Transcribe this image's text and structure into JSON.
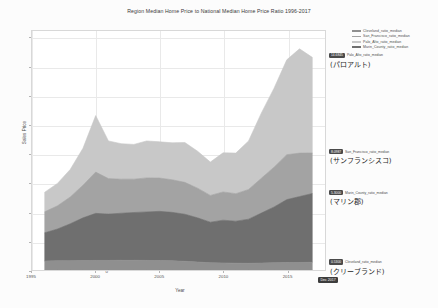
{
  "chart_data": {
    "type": "area",
    "title": "Region Median Home Price to National Median Home Price Ratio 1996-2017",
    "xlabel": "Year",
    "ylabel": "Sales Price",
    "stacked": true,
    "grid": true,
    "legend_position": "top-right",
    "xlim": [
      1995,
      2018
    ],
    "ylim": [
      0,
      16.5
    ],
    "xticks": [
      "1995",
      "2000",
      "2005",
      "2010",
      "2015"
    ],
    "yticks": [
      "0",
      "2",
      "4",
      "6",
      "8",
      "10",
      "12",
      "14",
      "16"
    ],
    "x": [
      1996,
      1997,
      1998,
      1999,
      2000,
      2001,
      2002,
      2003,
      2004,
      2005,
      2006,
      2007,
      2008,
      2009,
      2010,
      2011,
      2012,
      2013,
      2014,
      2015,
      2016,
      2017
    ],
    "series": [
      {
        "name": "Cleveland_ratio_median",
        "color": "#8f8f8f",
        "values": [
          0.62,
          0.63,
          0.64,
          0.65,
          0.66,
          0.66,
          0.67,
          0.67,
          0.66,
          0.65,
          0.63,
          0.6,
          0.55,
          0.5,
          0.49,
          0.47,
          0.46,
          0.48,
          0.5,
          0.51,
          0.52,
          0.53
        ]
      },
      {
        "name": "Marin_County_ratio_median",
        "color": "#6f6f6f",
        "values": [
          1.95,
          2.2,
          2.55,
          2.95,
          3.25,
          3.2,
          3.25,
          3.3,
          3.35,
          3.4,
          3.35,
          3.25,
          3.05,
          2.8,
          2.95,
          2.9,
          3.05,
          3.45,
          3.85,
          4.35,
          4.55,
          4.75
        ]
      },
      {
        "name": "San_Francisco_ratio_median",
        "color": "#a3a3a3",
        "values": [
          1.45,
          1.6,
          1.85,
          2.25,
          2.85,
          2.45,
          2.35,
          2.3,
          2.35,
          2.3,
          2.25,
          2.2,
          2.05,
          1.85,
          1.95,
          1.9,
          2.05,
          2.4,
          2.75,
          3.1,
          3.0,
          2.8
        ]
      },
      {
        "name": "Palo_Alto_ratio_median",
        "color": "#c8c8c8",
        "values": [
          1.35,
          1.55,
          1.9,
          2.55,
          3.9,
          2.6,
          2.45,
          2.4,
          2.55,
          2.5,
          2.55,
          2.75,
          2.55,
          2.3,
          2.7,
          2.8,
          3.35,
          4.5,
          5.45,
          6.55,
          7.2,
          6.6
        ]
      }
    ],
    "annotations": [
      {
        "series": "Palo_Alto_ratio_median",
        "badge": "14.6845",
        "label_jp": "(パロアルト)",
        "color": "#c8c8c8"
      },
      {
        "series": "San_Francisco_ratio_median",
        "badge": "8.0987",
        "label_jp": "(サンフランシスコ)",
        "color": "#a3a3a3"
      },
      {
        "series": "Marin_County_ratio_median",
        "badge": "5.3000",
        "label_jp": "(マリン郡)",
        "color": "#6f6f6f"
      },
      {
        "series": "Cleveland_ratio_median",
        "badge": "0.5300",
        "label_jp": "(クリーブランド)",
        "color": "#8f8f8f"
      }
    ],
    "date_badge": "Dec 2017"
  },
  "legend": {
    "items": [
      {
        "label": "Cleveland_ratio_median",
        "color": "#8f8f8f"
      },
      {
        "label": "San_Francisco_ratio_median",
        "color": "#a3a3a3"
      },
      {
        "label": "Palo_Alto_ratio_median",
        "color": "#c8c8c8"
      },
      {
        "label": "Marin_County_ratio_median",
        "color": "#6f6f6f"
      }
    ]
  }
}
